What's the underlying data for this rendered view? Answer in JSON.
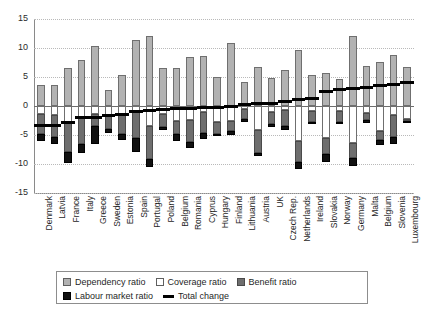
{
  "chart_data": {
    "type": "bar",
    "title": "",
    "subtitle": "",
    "xlabel": "",
    "ylabel": "",
    "ylim": [
      -15,
      15
    ],
    "yticks": [
      15,
      10,
      5,
      0,
      -5,
      -10,
      -15
    ],
    "ytick_labels": [
      "15",
      "10",
      "5",
      "0",
      "-5",
      "-10",
      "-15"
    ],
    "grid": true,
    "grid_axis": "y",
    "legend_position": "bottom",
    "stacked": true,
    "categories": [
      "Denmark",
      "Latvia",
      "France",
      "Italy",
      "Greece",
      "Sweden",
      "Estonia",
      "Spain",
      "Portugal",
      "Poland",
      "Belgium",
      "Romania",
      "Cyprus",
      "Hungary",
      "Finland",
      "Lithuania",
      "Austria",
      "UK",
      "Czech Rep.",
      "Netherlands",
      "Ireland",
      "Slovakia",
      "Norway",
      "Germany",
      "Malta",
      "Belgium",
      "Slovenia",
      "Luxembourg"
    ],
    "series": [
      {
        "name": "Dependency ratio",
        "color": "#b2b2b2",
        "values": [
          3.6,
          3.7,
          6.5,
          7.9,
          10.4,
          2.7,
          5.3,
          11.4,
          12.0,
          6.5,
          6.6,
          8.5,
          8.7,
          5.0,
          10.9,
          4.1,
          6.8,
          4.8,
          6.2,
          9.7,
          5.3,
          5.7,
          4.7,
          12.0,
          6.9,
          7.6,
          8.8,
          6.8
        ]
      },
      {
        "name": "Coverage ratio",
        "color": "#ffffff",
        "values": [
          -1.3,
          -1.5,
          -2.8,
          -2.1,
          -1.4,
          -1.7,
          -1.5,
          -1.0,
          -3.4,
          -1.4,
          -2.5,
          -2.4,
          -1.1,
          -2.8,
          -2.5,
          -0.5,
          -4.2,
          -1.0,
          -0.7,
          -6.0,
          -0.8,
          -5.6,
          -0.9,
          -6.4,
          -1.2,
          -4.3,
          -1.5,
          -2.2
        ]
      },
      {
        "name": "Benefit ratio",
        "color": "#6e6e6e",
        "values": [
          -3.6,
          -3.9,
          -5.1,
          -4.4,
          -2.1,
          -2.3,
          -3.4,
          -4.6,
          -5.8,
          -2.2,
          -2.4,
          -3.8,
          -3.6,
          -2.0,
          -1.8,
          -1.8,
          -3.9,
          -2.1,
          -2.7,
          -3.6,
          -1.9,
          -2.6,
          -1.9,
          -2.5,
          -1.2,
          -1.6,
          -3.9,
          -0.3
        ]
      },
      {
        "name": "Labour market ratio",
        "color": "#111111",
        "values": [
          -1.1,
          -1.1,
          -1.9,
          -1.6,
          -3.1,
          -0.6,
          -0.9,
          -2.3,
          -1.3,
          -0.6,
          -1.2,
          -1.0,
          -1.0,
          -0.3,
          -0.7,
          -0.5,
          -0.5,
          -0.5,
          -0.7,
          -1.3,
          -0.4,
          -1.4,
          -0.3,
          -1.4,
          -0.5,
          -0.8,
          -1.2,
          -0.2
        ]
      }
    ],
    "total_change": {
      "name": "Total change",
      "color": "#000000",
      "values": [
        -3.3,
        -3.3,
        -2.9,
        -1.9,
        -1.9,
        -1.6,
        -1.5,
        -0.9,
        -0.7,
        -0.6,
        -0.5,
        -0.4,
        -0.3,
        -0.2,
        -0.1,
        0.2,
        0.4,
        0.5,
        0.7,
        1.1,
        1.3,
        2.5,
        2.8,
        3.0,
        3.2,
        3.5,
        3.7,
        4.1
      ]
    }
  },
  "legend": {
    "items": [
      {
        "label": "Dependency ratio",
        "key": "dep"
      },
      {
        "label": "Coverage ratio",
        "key": "cov"
      },
      {
        "label": "Benefit ratio",
        "key": "ben"
      },
      {
        "label": "Labour market ratio",
        "key": "lab"
      },
      {
        "label": "Total change",
        "key": "tot"
      }
    ]
  }
}
